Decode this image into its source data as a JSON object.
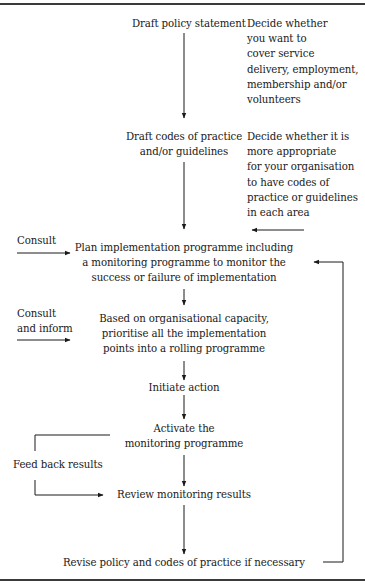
{
  "diagram": {
    "type": "flowchart",
    "steps": [
      {
        "id": "draft-policy",
        "label": "Draft policy statement"
      },
      {
        "id": "draft-codes",
        "lines": [
          "Draft codes of practice",
          "and/or guidelines"
        ]
      },
      {
        "id": "plan-implementation",
        "lines": [
          "Plan implementation programme including",
          "a monitoring programme to monitor the",
          "success or failure of implementation"
        ]
      },
      {
        "id": "prioritise",
        "lines": [
          "Based on organisational capacity,",
          "prioritise all the implementation",
          "points into a rolling programme"
        ]
      },
      {
        "id": "initiate",
        "label": "Initiate action"
      },
      {
        "id": "activate",
        "lines": [
          "Activate the",
          "monitoring programme"
        ]
      },
      {
        "id": "review",
        "label": "Review monitoring results"
      },
      {
        "id": "revise",
        "label": "Revise policy and codes of practice if necessary"
      }
    ],
    "notes": {
      "policy_note": [
        "Decide whether",
        "you want to",
        "cover service",
        "delivery, employment,",
        "membership and/or",
        "volunteers"
      ],
      "codes_note": [
        "Decide whether it is",
        "more appropriate",
        "for your organisation",
        "to have codes of",
        "practice or guidelines",
        "in each area"
      ]
    },
    "side_inputs": {
      "consult": "Consult",
      "consult_inform": [
        "Consult",
        "and inform"
      ],
      "feedback": "Feed back results"
    },
    "line_color": "#1a1a1a"
  }
}
